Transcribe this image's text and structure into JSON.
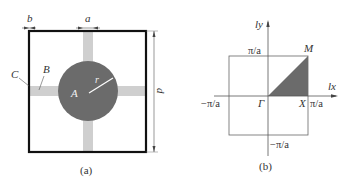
{
  "figure": {
    "panel_a": {
      "caption": "(a)",
      "labels": {
        "b": "b",
        "a": "a",
        "d": "d",
        "C": "C",
        "B": "B",
        "A": "A",
        "r": "r"
      },
      "colors": {
        "frame": "#111111",
        "circle": "#6b6b6b",
        "bar": "#cfcfcf"
      }
    },
    "panel_b": {
      "caption": "(b)",
      "axes": {
        "x": "lx",
        "y": "ly"
      },
      "ticks": {
        "top": "π/a",
        "right": "π/a",
        "left": "−π/a",
        "bottom": "−π/a"
      },
      "points": {
        "gamma": "Γ",
        "X": "X",
        "M": "M"
      },
      "colors": {
        "triangle": "#6b6b6b",
        "lines": "#555555"
      }
    }
  }
}
